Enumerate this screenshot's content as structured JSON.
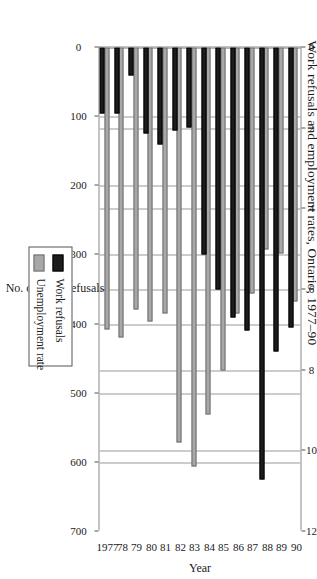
{
  "chart_data": {
    "type": "bar",
    "orientation": "vertical-grouped",
    "title": "Work refusals and employment rates, Ontario, 1977–90",
    "xlabel": "Year",
    "ylabel": "No. of work refusals",
    "y2label": "Unemployment rate",
    "categories": [
      "1977",
      "78",
      "79",
      "80",
      "81",
      "82",
      "83",
      "84",
      "85",
      "86",
      "87",
      "88",
      "89",
      "90"
    ],
    "ylim": [
      0,
      700
    ],
    "y2lim": [
      0,
      12
    ],
    "yticks": [
      0,
      100,
      200,
      300,
      400,
      500,
      600,
      700
    ],
    "yticklabels": [
      "0",
      "100",
      "200",
      "300",
      "400",
      "500",
      "600",
      "700"
    ],
    "y2ticks": [
      0,
      2,
      4,
      6,
      8,
      10,
      12
    ],
    "y2ticklabels": [
      "0",
      "2",
      "4",
      "6",
      "8",
      "10",
      "12"
    ],
    "grid": true,
    "legend_position": "right",
    "series": [
      {
        "name": "Work refusals",
        "color": "#1c1c1c",
        "axis": "primary",
        "values": [
          95,
          95,
          40,
          125,
          140,
          120,
          115,
          300,
          350,
          390,
          410,
          625,
          440,
          405
        ]
      },
      {
        "name": "Unemployment rate",
        "color": "#a8a8a8",
        "axis": "secondary",
        "values": [
          7.0,
          7.2,
          6.5,
          6.8,
          6.6,
          9.8,
          10.4,
          9.1,
          8.0,
          6.6,
          6.1,
          5.0,
          5.1,
          6.3
        ]
      }
    ]
  },
  "legend": {
    "items": [
      {
        "label": "Work refusals",
        "swatch": "refusals"
      },
      {
        "label": "Unemployment rate",
        "swatch": "unemp"
      }
    ]
  }
}
